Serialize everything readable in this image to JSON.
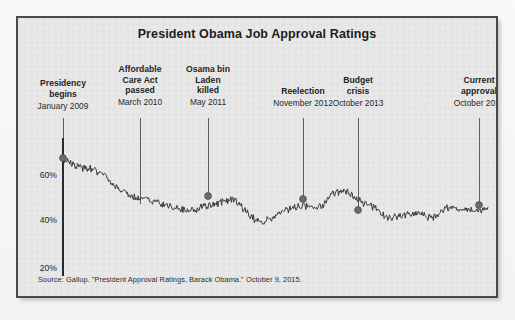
{
  "figure": {
    "title": "President Obama Job Approval Ratings",
    "source": "Source: Gallup. \"President Approval Ratings, Barack Obama.\" October 9, 2015.",
    "frame_color": "#4a4a4a",
    "background_color": "#e9e9e9",
    "line_color": "#3a3a3a",
    "marker_color": "#6b6b6b"
  },
  "annotations": [
    {
      "id": "presidency-begins",
      "title": "Presidency\nbegins",
      "title_lines": [
        "Presidency",
        "begins"
      ],
      "date": "January 2009",
      "x": 45,
      "label_top": 60,
      "line_top": 100,
      "marker_y": 140,
      "value": 67
    },
    {
      "id": "affordable-care-act",
      "title_lines": [
        "Affordable",
        "Care Act",
        "passed"
      ],
      "date": "March 2010",
      "x": 122,
      "label_top": 46,
      "line_top": 100,
      "marker_y": null,
      "value": 48
    },
    {
      "id": "osama-bin-laden-killed",
      "title_lines": [
        "Osama bin",
        "Laden",
        "killed"
      ],
      "date": "May 2011",
      "x": 190,
      "label_top": 46,
      "line_top": 100,
      "marker_y": 178,
      "value": 50
    },
    {
      "id": "reelection",
      "title_lines": [
        "Reelection"
      ],
      "date": "November 2012",
      "x": 285,
      "label_top": 68,
      "line_top": 100,
      "marker_y": 181,
      "value": 52
    },
    {
      "id": "budget-crisis",
      "title_lines": [
        "Budget",
        "crisis"
      ],
      "date": "October 2013",
      "x": 340,
      "label_top": 57,
      "line_top": 100,
      "marker_y": 192,
      "value": 42
    },
    {
      "id": "current-approval",
      "title_lines": [
        "Current",
        "approval"
      ],
      "date": "October 2015",
      "x": 461,
      "label_top": 57,
      "line_top": 100,
      "marker_y": 187,
      "value": 46
    }
  ],
  "chart_data": {
    "type": "line",
    "title": "President Obama Job Approval Ratings",
    "xlabel": "",
    "ylabel": "",
    "ylim": [
      15,
      72
    ],
    "yticks": [
      20,
      40,
      60
    ],
    "ytick_labels": [
      "20%",
      "40%",
      "60%"
    ],
    "grid": false,
    "legend": null,
    "x_range": [
      "January 2009",
      "October 2015"
    ],
    "series": [
      {
        "name": "Job approval (%)",
        "color": "#3a3a3a",
        "points": [
          {
            "label": "January 2009",
            "value": 67
          },
          {
            "label": "February 2009",
            "value": 64
          },
          {
            "label": "April 2009",
            "value": 63
          },
          {
            "label": "June 2009",
            "value": 60
          },
          {
            "label": "August 2009",
            "value": 54
          },
          {
            "label": "November 2009",
            "value": 51
          },
          {
            "label": "January 2010",
            "value": 50
          },
          {
            "label": "March 2010",
            "value": 48
          },
          {
            "label": "June 2010",
            "value": 46
          },
          {
            "label": "September 2010",
            "value": 45
          },
          {
            "label": "December 2010",
            "value": 47
          },
          {
            "label": "March 2011",
            "value": 48
          },
          {
            "label": "May 2011",
            "value": 50
          },
          {
            "label": "July 2011",
            "value": 44
          },
          {
            "label": "September 2011",
            "value": 40
          },
          {
            "label": "November 2011",
            "value": 43
          },
          {
            "label": "February 2012",
            "value": 46
          },
          {
            "label": "May 2012",
            "value": 47
          },
          {
            "label": "August 2012",
            "value": 46
          },
          {
            "label": "November 2012",
            "value": 52
          },
          {
            "label": "January 2013",
            "value": 53
          },
          {
            "label": "April 2013",
            "value": 49
          },
          {
            "label": "July 2013",
            "value": 46
          },
          {
            "label": "October 2013",
            "value": 42
          },
          {
            "label": "January 2014",
            "value": 43
          },
          {
            "label": "May 2014",
            "value": 44
          },
          {
            "label": "September 2014",
            "value": 42
          },
          {
            "label": "January 2015",
            "value": 46
          },
          {
            "label": "April 2015",
            "value": 46
          },
          {
            "label": "July 2015",
            "value": 45
          },
          {
            "label": "October 2015",
            "value": 46
          }
        ]
      }
    ],
    "markers": [
      {
        "label": "January 2009",
        "value": 67
      },
      {
        "label": "May 2011",
        "value": 50
      },
      {
        "label": "November 2012",
        "value": 52
      },
      {
        "label": "October 2013",
        "value": 42
      },
      {
        "label": "October 2015",
        "value": 46
      }
    ]
  },
  "axis": {
    "x_left": 45,
    "x_right": 470,
    "y_top_px": 120,
    "y_bottom_px": 258,
    "ticks": [
      {
        "label": "60%",
        "value": 60,
        "y": 158
      },
      {
        "label": "40%",
        "value": 40,
        "y": 203
      },
      {
        "label": "20%",
        "value": 20,
        "y": 251
      }
    ]
  }
}
